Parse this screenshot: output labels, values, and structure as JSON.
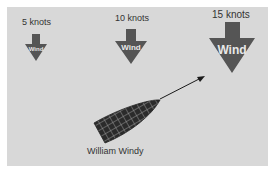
{
  "diagram": {
    "background": "#d8d8d8",
    "arrow_color": "#555555",
    "boat_color": "#2b2b2b",
    "wind_arrows": [
      {
        "speed_label": "5 knots",
        "arrow_label": "Wind",
        "size": "small"
      },
      {
        "speed_label": "10 knots",
        "arrow_label": "Wind",
        "size": "medium"
      },
      {
        "speed_label": "15 knots",
        "arrow_label": "Wind",
        "size": "large"
      }
    ],
    "boat": {
      "name": "William Windy",
      "icon": "boat-icon",
      "heading_icon": "heading-arrow-icon"
    }
  }
}
